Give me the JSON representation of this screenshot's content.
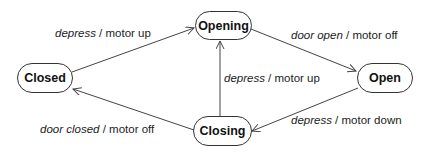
{
  "states": [
    {
      "id": "closed",
      "label": "Closed"
    },
    {
      "id": "opening",
      "label": "Opening"
    },
    {
      "id": "open",
      "label": "Open"
    },
    {
      "id": "closing",
      "label": "Closing"
    }
  ],
  "transitions": [
    {
      "from": "Closed",
      "to": "Opening",
      "event": "depress",
      "sep": " / ",
      "action": "motor up"
    },
    {
      "from": "Opening",
      "to": "Open",
      "event": "door open",
      "sep": " / ",
      "action": "motor off"
    },
    {
      "from": "Closing",
      "to": "Opening",
      "event": "depress",
      "sep": " / ",
      "action": "motor up"
    },
    {
      "from": "Open",
      "to": "Closing",
      "event": "depress",
      "sep": " / ",
      "action": "motor down"
    },
    {
      "from": "Closing",
      "to": "Closed",
      "event": "door closed",
      "sep": " / ",
      "action": "motor off"
    }
  ],
  "colors": {
    "line": "#444444",
    "text": "#222222",
    "background": "#ffffff"
  }
}
